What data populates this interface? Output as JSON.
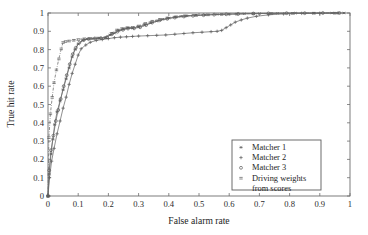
{
  "chart_data": {
    "type": "line",
    "title": "",
    "xlabel": "False alarm rate",
    "ylabel": "True hit rate",
    "xlim": [
      0,
      1
    ],
    "ylim": [
      0,
      1
    ],
    "grid": false,
    "legend_position": "lower-right-inside",
    "xticks": [
      "0",
      "0.1",
      "0.2",
      "0.3",
      "0.4",
      "0.5",
      "0.6",
      "0.7",
      "0.8",
      "0.9",
      "1"
    ],
    "xtick_values": [
      0,
      0.1,
      0.2,
      0.3,
      0.4,
      0.5,
      0.6,
      0.7,
      0.8,
      0.9,
      1
    ],
    "yticks": [
      "0",
      "0.1",
      "0.2",
      "0.3",
      "0.4",
      "0.5",
      "0.6",
      "0.7",
      "0.8",
      "0.9",
      "1"
    ],
    "ytick_values": [
      0,
      0.1,
      0.2,
      0.3,
      0.4,
      0.5,
      0.6,
      0.7,
      0.8,
      0.9,
      1
    ],
    "series": [
      {
        "name": "Matcher 1",
        "marker": "asterisk",
        "linestyle": "solid",
        "color": "#6b6b6b",
        "x": [
          0.0,
          0.004,
          0.01,
          0.016,
          0.022,
          0.03,
          0.04,
          0.05,
          0.06,
          0.07,
          0.08,
          0.09,
          0.1,
          0.115,
          0.13,
          0.15,
          0.17,
          0.19,
          0.205,
          0.22,
          0.235,
          0.25,
          0.265,
          0.28,
          0.3,
          0.32,
          0.34,
          0.36,
          0.38,
          0.4,
          0.42,
          0.44,
          0.46,
          0.49,
          0.52,
          0.56,
          0.6,
          0.65,
          0.7,
          0.76,
          0.82,
          0.88,
          0.94,
          0.98
        ],
        "y": [
          0.0,
          0.12,
          0.23,
          0.31,
          0.39,
          0.46,
          0.52,
          0.58,
          0.64,
          0.7,
          0.76,
          0.8,
          0.83,
          0.85,
          0.858,
          0.86,
          0.862,
          0.865,
          0.88,
          0.89,
          0.905,
          0.912,
          0.92,
          0.918,
          0.925,
          0.935,
          0.945,
          0.955,
          0.965,
          0.972,
          0.978,
          0.982,
          0.985,
          0.988,
          0.99,
          0.992,
          0.994,
          0.996,
          0.997,
          0.998,
          0.999,
          0.999,
          1.0,
          1.0
        ]
      },
      {
        "name": "Matcher 2",
        "marker": "plus",
        "linestyle": "solid",
        "color": "#6b6b6b",
        "x": [
          0.0,
          0.005,
          0.012,
          0.02,
          0.03,
          0.04,
          0.05,
          0.06,
          0.07,
          0.08,
          0.09,
          0.1,
          0.11,
          0.125,
          0.14,
          0.16,
          0.18,
          0.2,
          0.22,
          0.24,
          0.26,
          0.28,
          0.3,
          0.33,
          0.36,
          0.39,
          0.42,
          0.45,
          0.48,
          0.51,
          0.54,
          0.56,
          0.575,
          0.59,
          0.605,
          0.62,
          0.64,
          0.66,
          0.69,
          0.73,
          0.78,
          0.84,
          0.9,
          0.96
        ],
        "y": [
          0.0,
          0.1,
          0.19,
          0.26,
          0.34,
          0.41,
          0.48,
          0.54,
          0.61,
          0.67,
          0.72,
          0.77,
          0.805,
          0.825,
          0.84,
          0.85,
          0.855,
          0.86,
          0.865,
          0.868,
          0.87,
          0.872,
          0.874,
          0.876,
          0.878,
          0.88,
          0.884,
          0.888,
          0.892,
          0.895,
          0.898,
          0.9,
          0.905,
          0.92,
          0.935,
          0.95,
          0.962,
          0.972,
          0.982,
          0.99,
          0.995,
          0.998,
          0.999,
          1.0
        ]
      },
      {
        "name": "Matcher 3",
        "marker": "circle",
        "linestyle": "solid",
        "color": "#6b6b6b",
        "x": [
          0.0,
          0.004,
          0.01,
          0.018,
          0.026,
          0.034,
          0.042,
          0.052,
          0.062,
          0.072,
          0.082,
          0.092,
          0.104,
          0.118,
          0.134,
          0.155,
          0.175,
          0.195,
          0.212,
          0.23,
          0.248,
          0.265,
          0.285,
          0.305,
          0.325,
          0.345,
          0.37,
          0.395,
          0.42,
          0.45,
          0.48,
          0.515,
          0.55,
          0.59,
          0.63,
          0.68,
          0.73,
          0.79,
          0.85,
          0.91,
          0.965
        ],
        "y": [
          0.0,
          0.14,
          0.25,
          0.33,
          0.41,
          0.47,
          0.53,
          0.6,
          0.66,
          0.72,
          0.775,
          0.81,
          0.838,
          0.852,
          0.858,
          0.861,
          0.863,
          0.868,
          0.885,
          0.898,
          0.908,
          0.915,
          0.916,
          0.922,
          0.934,
          0.948,
          0.96,
          0.968,
          0.975,
          0.981,
          0.985,
          0.988,
          0.991,
          0.993,
          0.995,
          0.997,
          0.998,
          0.999,
          0.999,
          1.0,
          1.0
        ]
      },
      {
        "name": "Driving weights from scores",
        "marker": "dotted",
        "linestyle": "dash-dot",
        "color": "#8a8a8a",
        "x": [
          0.0,
          0.003,
          0.008,
          0.014,
          0.02,
          0.028,
          0.036,
          0.044,
          0.05,
          0.058,
          0.07,
          0.085,
          0.1,
          0.12,
          0.14,
          0.165,
          0.19,
          0.21,
          0.228,
          0.245,
          0.262,
          0.28,
          0.3,
          0.322,
          0.345,
          0.37,
          0.395,
          0.425,
          0.455,
          0.49,
          0.53,
          0.575,
          0.625,
          0.68,
          0.74,
          0.81,
          0.88,
          0.95
        ],
        "y": [
          0.0,
          0.32,
          0.45,
          0.54,
          0.62,
          0.69,
          0.75,
          0.805,
          0.84,
          0.845,
          0.848,
          0.852,
          0.856,
          0.86,
          0.862,
          0.864,
          0.866,
          0.89,
          0.908,
          0.916,
          0.92,
          0.922,
          0.93,
          0.944,
          0.956,
          0.966,
          0.974,
          0.98,
          0.985,
          0.988,
          0.991,
          0.993,
          0.995,
          0.997,
          0.998,
          0.999,
          1.0,
          1.0
        ]
      }
    ]
  },
  "legend": {
    "items": [
      {
        "label": "Matcher 1",
        "marker": "asterisk"
      },
      {
        "label": "Matcher 2",
        "marker": "plus"
      },
      {
        "label": "Matcher 3",
        "marker": "circle"
      },
      {
        "label": "Driving weights",
        "marker": "dotted"
      },
      {
        "label": "from scores",
        "marker": "none"
      }
    ]
  }
}
